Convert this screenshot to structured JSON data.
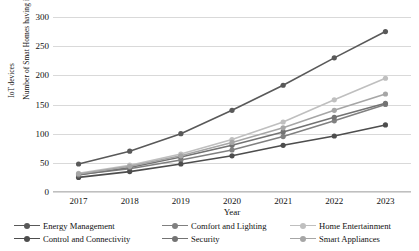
{
  "chart_data": {
    "type": "line",
    "title": "",
    "xlabel": "Year",
    "ylabel_line1": "Number of Smat Homes having implemented",
    "ylabel_line2": "IoT devices",
    "categories": [
      "2017",
      "2018",
      "2019",
      "2020",
      "2021",
      "2022",
      "2023"
    ],
    "x": [
      2017,
      2018,
      2019,
      2020,
      2021,
      2022,
      2023
    ],
    "ylim": [
      0,
      300
    ],
    "yticks": [
      0,
      50,
      100,
      150,
      200,
      250,
      300
    ],
    "grid": true,
    "legend_position": "bottom",
    "series": [
      {
        "name": "Energy Management",
        "color": "#595959",
        "values": [
          48,
          70,
          100,
          140,
          183,
          230,
          275
        ]
      },
      {
        "name": "Comfort and Lighting",
        "color": "#808080",
        "values": [
          30,
          40,
          55,
          72,
          95,
          122,
          150
        ]
      },
      {
        "name": "Home Entertainment",
        "color": "#bfbfbf",
        "values": [
          32,
          46,
          65,
          90,
          120,
          158,
          195
        ]
      },
      {
        "name": "Control and Connectivity",
        "color": "#4d4d4d",
        "values": [
          25,
          35,
          48,
          62,
          80,
          96,
          115
        ]
      },
      {
        "name": "Security",
        "color": "#737373",
        "values": [
          29,
          42,
          60,
          80,
          103,
          128,
          152
        ]
      },
      {
        "name": "Smart Appliances",
        "color": "#a6a6a6",
        "values": [
          31,
          44,
          62,
          85,
          110,
          140,
          168
        ]
      }
    ]
  },
  "legend": {
    "items": [
      {
        "label": "Energy Management",
        "color": "#595959"
      },
      {
        "label": "Comfort and Lighting",
        "color": "#808080"
      },
      {
        "label": "Home Entertainment",
        "color": "#bfbfbf"
      },
      {
        "label": "Control and Connectivity",
        "color": "#4d4d4d"
      },
      {
        "label": "Security",
        "color": "#737373"
      },
      {
        "label": "Smart Appliances",
        "color": "#a6a6a6"
      }
    ]
  }
}
